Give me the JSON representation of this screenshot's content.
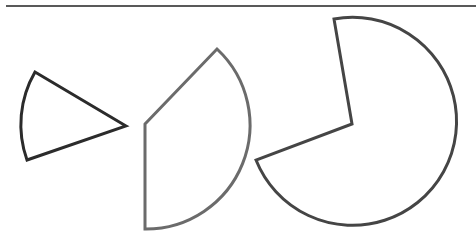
{
  "diagram": {
    "background": "#ffffff",
    "top_rule": {
      "x1": 6,
      "y1": 6,
      "x2": 476,
      "y2": 6,
      "color": "#222222",
      "width": 1.5
    },
    "sectors": [
      {
        "id": "sector-1",
        "center": [
          126,
          126
        ],
        "radius": 105,
        "start": [
          35,
          72
        ],
        "end": [
          27,
          160
        ],
        "large_arc": 0,
        "sweep": 0,
        "stroke": "#2b2b2b",
        "stroke_width": 3
      },
      {
        "id": "sector-2",
        "center": [
          145,
          124
        ],
        "radius": 104,
        "start": [
          217,
          49
        ],
        "end": [
          145,
          229
        ],
        "large_arc": 0,
        "sweep": 1,
        "stroke": "#6b6b6b",
        "stroke_width": 3
      },
      {
        "id": "sector-3",
        "center": [
          352,
          124
        ],
        "radius": 104,
        "start": [
          334,
          19
        ],
        "end": [
          256,
          160
        ],
        "large_arc": 1,
        "sweep": 1,
        "stroke": "#454545",
        "stroke_width": 3
      }
    ]
  }
}
